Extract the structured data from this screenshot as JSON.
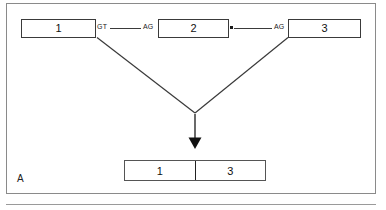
{
  "figure": {
    "panel_letter": "A",
    "caption_text": ""
  },
  "pre_mrna": {
    "exons": [
      {
        "label": "1",
        "name": "exon-1"
      },
      {
        "label": "2",
        "name": "exon-2"
      },
      {
        "label": "3",
        "name": "exon-3"
      }
    ],
    "splice_sites": [
      {
        "label": "GT",
        "name": "donor-site-gt"
      },
      {
        "label": "AG",
        "name": "acceptor-site-ag-1"
      },
      {
        "label": "AG",
        "name": "acceptor-site-ag-2"
      }
    ],
    "branch_point_marker": "•"
  },
  "spliced_product": {
    "segments": [
      {
        "label": "1"
      },
      {
        "label": "3"
      }
    ]
  },
  "colors": {
    "frame": "#8a8a8a",
    "box_border": "#3a3a3a",
    "line": "#3a3a3a",
    "text": "#111111",
    "background": "#ffffff"
  }
}
